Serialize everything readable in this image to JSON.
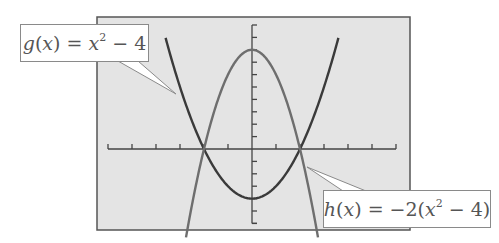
{
  "chart_data": {
    "type": "line",
    "title": "",
    "xlabel": "",
    "ylabel": "",
    "xlim": [
      -6,
      6
    ],
    "ylim": [
      -6,
      10
    ],
    "x_tick_step": 1,
    "y_tick_step": 1,
    "grid": false,
    "background": "#e4e4e4",
    "series": [
      {
        "name": "g(x) = x^2 - 4",
        "expression": "x^2 - 4",
        "color": "#3a3a3a",
        "x": [
          -3.6,
          -3,
          -2,
          -1,
          0,
          1,
          2,
          3,
          3.6
        ],
        "values": [
          8.96,
          5,
          0,
          -3,
          -4,
          -3,
          0,
          5,
          8.96
        ]
      },
      {
        "name": "h(x) = -2(x^2 - 4)",
        "expression": "-2(x^2 - 4)",
        "color": "#6e6e6e",
        "x": [
          -2.75,
          -2,
          -1,
          0,
          1,
          2,
          2.75
        ],
        "values": [
          -7.13,
          0,
          6,
          8,
          6,
          0,
          -7.13
        ]
      }
    ],
    "intersections": [
      [
        -2,
        0
      ],
      [
        2,
        0
      ]
    ],
    "annotations": [
      {
        "text": "g(x) = x^2 - 4",
        "target_series": "g(x) = x^2 - 4"
      },
      {
        "text": "h(x) = -2(x^2 - 4)",
        "target_series": "h(x) = -2(x^2 - 4)"
      }
    ]
  },
  "labels": {
    "g": {
      "fn": "g",
      "var": "x",
      "base": "x",
      "exp": "2",
      "tail": " − 4"
    },
    "h": {
      "fn": "h",
      "var": "x",
      "pre": " = −2(",
      "base": "x",
      "exp": "2",
      "tail": " − 4)"
    }
  }
}
